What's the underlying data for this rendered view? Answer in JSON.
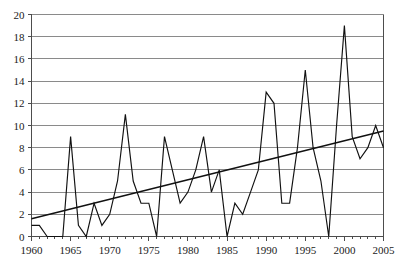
{
  "chart_data": {
    "type": "line",
    "title": "",
    "subtitle": "",
    "xlabel": "",
    "ylabel": "",
    "xlim": [
      1960,
      2005
    ],
    "ylim": [
      0,
      20
    ],
    "x_ticks": [
      1960,
      1965,
      1970,
      1975,
      1980,
      1985,
      1990,
      1995,
      2000,
      2005
    ],
    "x_tick_labels": [
      "1960",
      "1965",
      "1970",
      "1975",
      "1980",
      "1985",
      "1990",
      "1995",
      "2000",
      "2005"
    ],
    "x_minor_ticks": [
      1961,
      1962,
      1963,
      1964,
      1966,
      1967,
      1968,
      1969,
      1971,
      1972,
      1973,
      1974,
      1976,
      1977,
      1978,
      1979,
      1981,
      1982,
      1983,
      1984,
      1986,
      1987,
      1988,
      1989,
      1991,
      1992,
      1993,
      1994,
      1996,
      1997,
      1998,
      1999,
      2001,
      2002,
      2003,
      2004
    ],
    "y_ticks": [
      0,
      2,
      4,
      6,
      8,
      10,
      12,
      14,
      16,
      18,
      20
    ],
    "y_tick_labels": [
      "0",
      "2",
      "4",
      "6",
      "8",
      "10",
      "12",
      "14",
      "16",
      "18",
      "20"
    ],
    "grid": "horizontal",
    "legend": "none",
    "line_color": "#111111",
    "grid_color": "#8a8a8a",
    "axis_color": "#4d4d4d",
    "background_color": "#ffffff",
    "x": [
      1960,
      1961,
      1962,
      1963,
      1964,
      1965,
      1966,
      1967,
      1968,
      1969,
      1970,
      1971,
      1972,
      1973,
      1974,
      1975,
      1976,
      1977,
      1978,
      1979,
      1980,
      1981,
      1982,
      1983,
      1984,
      1985,
      1986,
      1987,
      1988,
      1989,
      1990,
      1991,
      1992,
      1993,
      1994,
      1995,
      1996,
      1997,
      1998,
      1999,
      2000,
      2001,
      2002,
      2003,
      2004,
      2005
    ],
    "series": [
      {
        "name": "observed",
        "values": [
          1,
          1,
          0,
          0,
          0,
          9,
          1,
          0,
          3,
          1,
          2,
          5,
          11,
          5,
          3,
          3,
          0,
          9,
          6,
          3,
          4,
          6,
          9,
          4,
          6,
          0,
          3,
          2,
          4,
          6,
          13,
          12,
          3,
          3,
          8,
          15,
          8,
          5,
          0,
          10,
          19,
          9,
          7,
          8,
          10,
          8
        ]
      },
      {
        "name": "linear-trend",
        "type": "line",
        "endpoints": [
          [
            1960,
            1.6
          ],
          [
            2005,
            9.5
          ]
        ]
      }
    ]
  },
  "axes": {
    "y_axis_name": "value-axis",
    "x_axis_name": "year-axis"
  }
}
